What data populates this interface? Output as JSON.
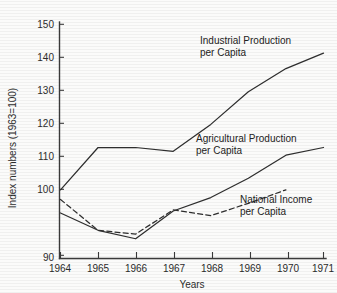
{
  "chart_data": {
    "type": "line",
    "title": "",
    "subtitle": "",
    "xlabel": "Years",
    "ylabel": "Index numbers (1963=100)",
    "x": [
      1964,
      1965,
      1966,
      1967,
      1968,
      1969,
      1970,
      1971
    ],
    "xticklabels": [
      "1964",
      "1965",
      "1966",
      "1967",
      "1968",
      "1969",
      "1970",
      "1971"
    ],
    "yticks": [
      90,
      100,
      110,
      120,
      130,
      140,
      150
    ],
    "yticklabels": [
      "90",
      "100",
      "110",
      "120",
      "130",
      "140",
      "150"
    ],
    "xlim": [
      1964,
      1971
    ],
    "ylim": [
      90,
      150
    ],
    "grid": false,
    "legend_position": "inline-annotations",
    "series": [
      {
        "name": "Industrial Production per Capita",
        "style": "solid",
        "color": "#2e2e2e",
        "x": [
          1964,
          1965,
          1966,
          1967,
          1968,
          1969,
          1970,
          1971
        ],
        "values": [
          107.0,
          118.0,
          118.0,
          117.0,
          124.0,
          132.5,
          138.5,
          142.5
        ]
      },
      {
        "name": "Agricultural Production per Capita",
        "style": "solid",
        "color": "#2e2e2e",
        "x": [
          1964,
          1965,
          1966,
          1967,
          1968,
          1969,
          1970,
          1971
        ],
        "values": [
          101.0,
          96.5,
          94.3,
          101.5,
          105.0,
          110.0,
          116.0,
          118.0
        ]
      },
      {
        "name": "National Income per Capita",
        "style": "dashed",
        "color": "#2e2e2e",
        "x": [
          1964,
          1965,
          1966,
          1967,
          1968,
          1969,
          1970
        ],
        "values": [
          104.5,
          96.5,
          95.5,
          101.8,
          100.3,
          103.5,
          107.0
        ]
      }
    ],
    "annotations": [
      {
        "id": "industrial",
        "line1": "Industrial Production",
        "line2": "per Capita"
      },
      {
        "id": "agricultural",
        "line1": "Agricultural Production",
        "line2": "per Capita"
      },
      {
        "id": "national-income",
        "line1": "National Income",
        "line2": "per Capita"
      }
    ]
  }
}
